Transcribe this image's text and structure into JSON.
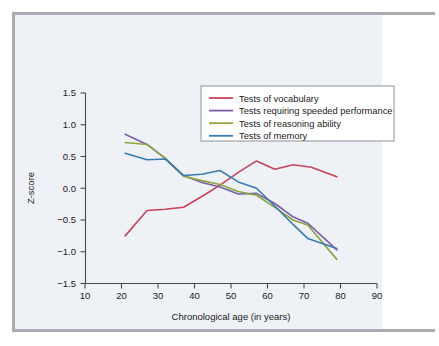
{
  "figure": {
    "frame_color": "#a9adb2",
    "panel_tint": "#eef1f6",
    "background": "#ffffff"
  },
  "chart_data": {
    "type": "line",
    "title": "",
    "xlabel": "Chronological age (in years)",
    "ylabel": "Z-score",
    "xlim": [
      10,
      90
    ],
    "ylim": [
      -1.5,
      1.5
    ],
    "xticks": [
      10,
      20,
      30,
      40,
      50,
      60,
      70,
      80,
      90
    ],
    "xtick_labels": [
      "10",
      "20",
      "30",
      "40",
      "50",
      "60",
      "70",
      "80",
      "90"
    ],
    "yticks": [
      -1.5,
      -1.0,
      -0.5,
      0.0,
      0.5,
      1.0,
      1.5
    ],
    "ytick_labels": [
      "−1.5",
      "−1.0",
      "−0.5",
      "0.0",
      "0.5",
      "1.0",
      "1.5"
    ],
    "grid": false,
    "legend_position": "upper right",
    "series": [
      {
        "name": "Tests of vocabulary",
        "color": "#c9435b",
        "x": [
          21,
          27,
          32,
          37,
          42,
          47,
          52,
          57,
          62,
          67,
          72,
          79
        ],
        "values": [
          -0.75,
          -0.35,
          -0.33,
          -0.3,
          -0.13,
          0.05,
          0.25,
          0.43,
          0.3,
          0.37,
          0.33,
          0.18
        ]
      },
      {
        "name": "Tests requiring speeded performance",
        "color": "#7b5ea7",
        "x": [
          21,
          27,
          32,
          37,
          42,
          47,
          52,
          57,
          62,
          67,
          71,
          79
        ],
        "values": [
          0.85,
          0.69,
          0.47,
          0.2,
          0.09,
          0.02,
          -0.09,
          -0.08,
          -0.24,
          -0.45,
          -0.55,
          -0.97
        ]
      },
      {
        "name": "Tests of reasoning ability",
        "color": "#8aa63c",
        "x": [
          21,
          27,
          32,
          37,
          42,
          47,
          52,
          57,
          62,
          67,
          71,
          79
        ],
        "values": [
          0.72,
          0.69,
          0.47,
          0.19,
          0.12,
          0.06,
          -0.05,
          -0.11,
          -0.3,
          -0.5,
          -0.58,
          -1.12
        ]
      },
      {
        "name": "Tests of memory",
        "color": "#3a7ab0",
        "x": [
          21,
          27,
          32,
          37,
          42,
          47,
          52,
          57,
          62,
          67,
          71,
          79
        ],
        "values": [
          0.55,
          0.45,
          0.46,
          0.2,
          0.22,
          0.28,
          0.1,
          0.0,
          -0.28,
          -0.57,
          -0.79,
          -0.95
        ]
      }
    ]
  },
  "legend": {
    "items": [
      {
        "label": "Tests of vocabulary",
        "color": "#c9435b"
      },
      {
        "label": "Tests requiring speeded performance",
        "color": "#7b5ea7"
      },
      {
        "label": "Tests of reasoning ability",
        "color": "#8aa63c"
      },
      {
        "label": "Tests of memory",
        "color": "#3a7ab0"
      }
    ]
  }
}
